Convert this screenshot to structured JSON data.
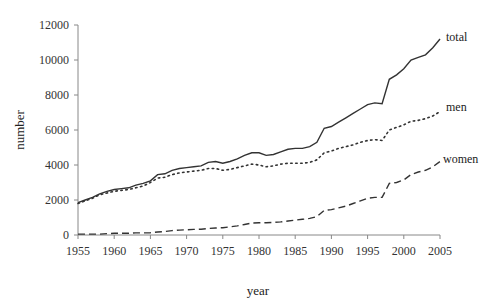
{
  "chart_data": {
    "type": "line",
    "title": "",
    "xlabel": "year",
    "ylabel": "number",
    "xlim": [
      1955,
      2005
    ],
    "ylim": [
      0,
      12000
    ],
    "grid": false,
    "legend_position": "inline-right",
    "x_ticks": [
      "1955",
      "1960",
      "1965",
      "1970",
      "1975",
      "1980",
      "1985",
      "1990",
      "1995",
      "2000",
      "2005"
    ],
    "y_ticks": [
      "0",
      "2000",
      "4000",
      "6000",
      "8000",
      "10000",
      "12000"
    ],
    "x": [
      1955,
      1956,
      1957,
      1958,
      1959,
      1960,
      1961,
      1962,
      1963,
      1964,
      1965,
      1966,
      1967,
      1968,
      1969,
      1970,
      1971,
      1972,
      1973,
      1974,
      1975,
      1976,
      1977,
      1978,
      1979,
      1980,
      1981,
      1982,
      1983,
      1984,
      1985,
      1986,
      1987,
      1988,
      1989,
      1990,
      1991,
      1992,
      1993,
      1994,
      1995,
      1996,
      1997,
      1998,
      1999,
      2000,
      2001,
      2002,
      2003,
      2004,
      2005
    ],
    "series": [
      {
        "name": "total",
        "style": "solid",
        "values": [
          1850,
          2000,
          2150,
          2350,
          2500,
          2600,
          2650,
          2700,
          2850,
          2950,
          3100,
          3450,
          3500,
          3700,
          3800,
          3850,
          3900,
          3950,
          4150,
          4200,
          4100,
          4200,
          4350,
          4550,
          4700,
          4700,
          4550,
          4600,
          4750,
          4900,
          4950,
          4950,
          5050,
          5300,
          6100,
          6200,
          6450,
          6700,
          6950,
          7200,
          7450,
          7550,
          7500,
          8900,
          9150,
          9500,
          10000,
          10150,
          10300,
          10700,
          11200
        ]
      },
      {
        "name": "men",
        "style": "dotted",
        "values": [
          1800,
          1950,
          2100,
          2300,
          2400,
          2500,
          2550,
          2600,
          2700,
          2800,
          3000,
          3250,
          3300,
          3450,
          3550,
          3600,
          3650,
          3700,
          3800,
          3800,
          3700,
          3750,
          3850,
          3950,
          4050,
          4000,
          3900,
          3950,
          4050,
          4100,
          4100,
          4100,
          4150,
          4300,
          4700,
          4800,
          4950,
          5050,
          5150,
          5300,
          5400,
          5450,
          5400,
          6000,
          6150,
          6300,
          6500,
          6550,
          6650,
          6800,
          7050
        ]
      },
      {
        "name": "women",
        "style": "dashed",
        "values": [
          50,
          50,
          50,
          50,
          80,
          100,
          100,
          100,
          120,
          120,
          130,
          170,
          200,
          250,
          280,
          300,
          320,
          330,
          370,
          400,
          420,
          470,
          520,
          600,
          680,
          700,
          700,
          720,
          750,
          800,
          850,
          900,
          950,
          1050,
          1400,
          1450,
          1550,
          1650,
          1800,
          1950,
          2100,
          2150,
          2150,
          2950,
          3000,
          3150,
          3450,
          3600,
          3700,
          3900,
          4200
        ]
      }
    ]
  },
  "labels": {
    "total": "total",
    "men": "men",
    "women": "women",
    "xlabel": "year",
    "ylabel": "number"
  }
}
